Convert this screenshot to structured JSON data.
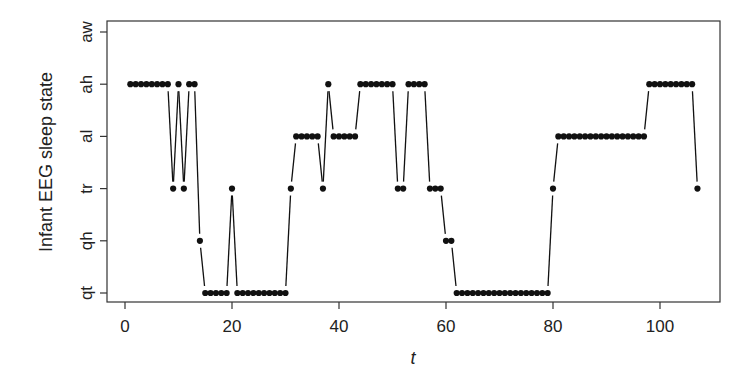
{
  "chart_data": {
    "type": "line",
    "style": "points-and-lines (type b)",
    "title": "",
    "xlabel": "t",
    "ylabel": "Infant EEG sleep state",
    "xlim": [
      0,
      110
    ],
    "x_ticks": [
      0,
      20,
      40,
      60,
      80,
      100
    ],
    "y_categories": [
      "qt",
      "qh",
      "tr",
      "al",
      "ah",
      "aw"
    ],
    "grid": false,
    "legend": null,
    "x": [
      1,
      2,
      3,
      4,
      5,
      6,
      7,
      8,
      9,
      10,
      11,
      12,
      13,
      14,
      15,
      16,
      17,
      18,
      19,
      20,
      21,
      22,
      23,
      24,
      25,
      26,
      27,
      28,
      29,
      30,
      31,
      32,
      33,
      34,
      35,
      36,
      37,
      38,
      39,
      40,
      41,
      42,
      43,
      44,
      45,
      46,
      47,
      48,
      49,
      50,
      51,
      52,
      53,
      54,
      55,
      56,
      57,
      58,
      59,
      60,
      61,
      62,
      63,
      64,
      65,
      66,
      67,
      68,
      69,
      70,
      71,
      72,
      73,
      74,
      75,
      76,
      77,
      78,
      79,
      80,
      81,
      82,
      83,
      84,
      85,
      86,
      87,
      88,
      89,
      90,
      91,
      92,
      93,
      94,
      95,
      96,
      97,
      98,
      99,
      100,
      101,
      102,
      103,
      104,
      105,
      106,
      107
    ],
    "values": [
      "ah",
      "ah",
      "ah",
      "ah",
      "ah",
      "ah",
      "ah",
      "ah",
      "tr",
      "ah",
      "tr",
      "ah",
      "ah",
      "qh",
      "qt",
      "qt",
      "qt",
      "qt",
      "qt",
      "tr",
      "qt",
      "qt",
      "qt",
      "qt",
      "qt",
      "qt",
      "qt",
      "qt",
      "qt",
      "qt",
      "tr",
      "al",
      "al",
      "al",
      "al",
      "al",
      "tr",
      "ah",
      "al",
      "al",
      "al",
      "al",
      "al",
      "ah",
      "ah",
      "ah",
      "ah",
      "ah",
      "ah",
      "ah",
      "tr",
      "tr",
      "ah",
      "ah",
      "ah",
      "ah",
      "tr",
      "tr",
      "tr",
      "qh",
      "qh",
      "qt",
      "qt",
      "qt",
      "qt",
      "qt",
      "qt",
      "qt",
      "qt",
      "qt",
      "qt",
      "qt",
      "qt",
      "qt",
      "qt",
      "qt",
      "qt",
      "qt",
      "qt",
      "tr",
      "al",
      "al",
      "al",
      "al",
      "al",
      "al",
      "al",
      "al",
      "al",
      "al",
      "al",
      "al",
      "al",
      "al",
      "al",
      "al",
      "al",
      "ah",
      "ah",
      "ah",
      "ah",
      "ah",
      "ah",
      "ah",
      "ah",
      "ah",
      "tr"
    ]
  },
  "axes": {
    "xlabel": "t",
    "ylabel": "Infant EEG sleep state",
    "x_tick_labels": [
      "0",
      "20",
      "40",
      "60",
      "80",
      "100"
    ],
    "y_tick_labels": [
      "qt",
      "qh",
      "tr",
      "al",
      "ah",
      "aw"
    ]
  },
  "colors": {
    "points": "#111111",
    "lines": "#111111",
    "axes": "#333333"
  }
}
